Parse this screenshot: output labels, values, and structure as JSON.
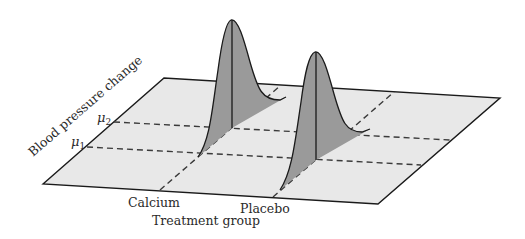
{
  "diagram": {
    "type": "3d-perspective-normal-distributions",
    "y_axis_label": "Blood pressure change",
    "x_axis_label": "Treatment group",
    "mean_labels": [
      {
        "symbol": "μ",
        "subscript": "2"
      },
      {
        "symbol": "μ",
        "subscript": "1"
      }
    ],
    "groups": [
      {
        "label": "Calcium",
        "mean_ref": "μ1"
      },
      {
        "label": "Placebo",
        "mean_ref": "μ2"
      }
    ],
    "colors": {
      "plane_fill": "#e8e8e8",
      "curve_fill": "#9a9a9a",
      "outline": "#1a1a1a",
      "dashed": "#3a3a3a",
      "background": "#ffffff"
    }
  }
}
